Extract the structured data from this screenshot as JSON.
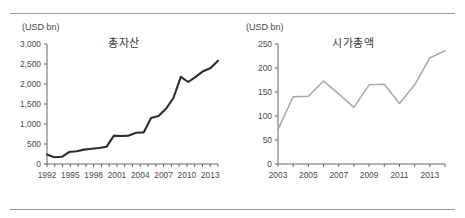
{
  "page": {
    "clipped_header_text": "",
    "background_color": "#ffffff",
    "rule_color": "#9a9a9a"
  },
  "chart_data": [
    {
      "id": "total-assets",
      "type": "line",
      "title": "총자산",
      "unit_label": "(USD bn)",
      "xlabel": "",
      "ylabel": "",
      "ylim": [
        0,
        3000
      ],
      "ytick_values": [
        0,
        500,
        1000,
        1500,
        2000,
        2500,
        3000
      ],
      "ytick_labels": [
        "0",
        "500",
        "1,000",
        "1,500",
        "2,000",
        "2,500",
        "3,000"
      ],
      "xlim": [
        1992,
        2014
      ],
      "xtick_labels": [
        "1992",
        "1995",
        "1998",
        "2001",
        "2004",
        "2007",
        "2010",
        "2013"
      ],
      "xtick_values": [
        1992,
        1995,
        1998,
        2001,
        2004,
        2007,
        2010,
        2013
      ],
      "minor_tick_step": 1,
      "grid": false,
      "legend": "none",
      "series_color": "#2e2e2e",
      "x": [
        1992,
        1993,
        1994,
        1995,
        1996,
        1997,
        1998,
        1999,
        2000,
        2001,
        2002,
        2003,
        2004,
        2005,
        2006,
        2007,
        2008,
        2009,
        2010,
        2011,
        2012,
        2013,
        2014
      ],
      "values": [
        240,
        170,
        180,
        300,
        320,
        360,
        380,
        400,
        430,
        710,
        700,
        710,
        780,
        790,
        1150,
        1200,
        1380,
        1650,
        2180,
        2050,
        2180,
        2320,
        2400,
        2580
      ]
    },
    {
      "id": "market-cap",
      "type": "line",
      "title": "시가총액",
      "unit_label": "(USD bn)",
      "xlabel": "",
      "ylabel": "",
      "ylim": [
        0,
        250
      ],
      "ytick_values": [
        0,
        50,
        100,
        150,
        200,
        250
      ],
      "ytick_labels": [
        "0",
        "50",
        "100",
        "150",
        "200",
        "250"
      ],
      "xlim": [
        2003,
        2014
      ],
      "xtick_labels": [
        "2003",
        "2005",
        "2007",
        "2009",
        "2011",
        "2013"
      ],
      "xtick_values": [
        2003,
        2005,
        2007,
        2009,
        2011,
        2013
      ],
      "minor_tick_step": 1,
      "grid": false,
      "legend": "none",
      "series_color": "#a8a8a8",
      "x": [
        2003,
        2004,
        2005,
        2006,
        2007,
        2008,
        2009,
        2010,
        2011,
        2012,
        2013,
        2014
      ],
      "values": [
        72,
        140,
        141,
        173,
        146,
        118,
        165,
        166,
        126,
        165,
        221,
        236
      ]
    }
  ]
}
